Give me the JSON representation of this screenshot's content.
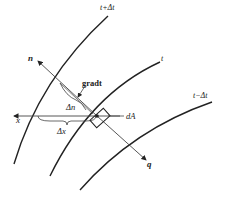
{
  "diagram": {
    "isotherms": [
      {
        "id": "upper",
        "label": "t+Δt"
      },
      {
        "id": "middle",
        "label": "t"
      },
      {
        "id": "lower",
        "label": "t−Δt"
      }
    ],
    "vectors": {
      "normal": {
        "label": "n"
      },
      "heat_flux": {
        "label": "q"
      },
      "x_axis": {
        "label": "x"
      },
      "gradient": {
        "label": "gradt"
      }
    },
    "dimensions": {
      "delta_n": "Δn",
      "delta_x": "Δx"
    },
    "element": {
      "label": "dA"
    },
    "colors": {
      "line": "#222222",
      "background": "#ffffff"
    }
  }
}
